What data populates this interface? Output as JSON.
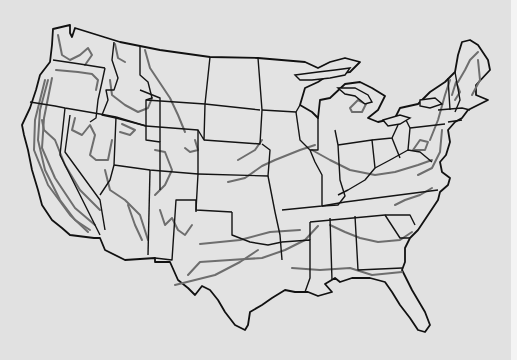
{
  "map": {
    "subject": "Contiguous United States with state boundaries and gray isolines",
    "colors": {
      "background": "#e1e1e1",
      "right_strip": "#f4f4f4",
      "land": "#e3e3e3",
      "state_borders": "#141414",
      "isolines": "#6e6e6e"
    },
    "outline": "M53,29 L70,25 L70,33 L72,37 L75,28 L120,42 L160,50 L210,57 L258,58 L305,62 L318,68 L330,62 L345,58 L360,62 L350,72 L330,74 L318,82 L305,88 L300,105 L312,112 L318,118 L320,100 L330,98 L345,84 L360,82 L372,88 L385,96 L378,110 L368,118 L378,122 L395,118 L400,108 L418,104 L430,92 L445,82 L455,72 L458,55 L462,42 L470,40 L478,45 L488,60 L490,70 L476,85 L476,95 L488,100 L468,110 L462,118 L455,122 L448,130 L450,142 L446,155 L440,162 L442,172 L450,178 L448,185 L440,192 L438,200 L428,215 L418,230 L410,238 L405,248 L405,262 L402,270 L412,290 L425,312 L430,325 L425,332 L418,330 L410,318 L400,305 L392,292 L385,282 L370,278 L352,278 L340,282 L335,278 L325,284 L332,292 L318,296 L308,292 L295,292 L285,290 L272,298 L262,305 L250,312 L248,325 L245,330 L235,325 L225,312 L218,300 L210,290 L202,286 L195,295 L188,288 L178,280 L170,262 L155,262 L155,258 L125,260 L105,250 L100,238 L94,238 L70,235 L62,228 L52,220 L42,205 L38,190 L32,170 L28,150 L24,135 L22,125 L30,108 L36,90 L40,75 L50,62 L52,45 Z",
    "lakes": [
      "M295,75 L318,72 L335,70 L350,68 L345,75 L330,78 L312,80 L300,80 Z",
      "M338,88 L355,88 L368,95 L372,102 L365,104 L355,96 L345,94 Z",
      "M383,120 L400,115 L410,118 L400,124 L388,126 Z",
      "M420,100 L435,98 L442,104 L430,108 L420,106 Z"
    ],
    "borders": [
      "M30,102 L55,106 L65,108 L100,114 L116,117",
      "M53,60 L80,64 L105,68",
      "M105,68 L102,82 L98,100 L96,118 L90,122",
      "M114,42 L112,60 L118,78 L114,90 L106,90 L108,100 L102,115 L116,118 L146,126 L146,100 L152,98 L148,82 L140,75 L140,46",
      "M65,108 L60,155 L100,235",
      "M70,115 L65,152 L100,200 L105,230",
      "M116,117 L114,165 L110,180 L100,195",
      "M116,117 L146,126 L146,140 L160,142 L160,190",
      "M114,165 L150,170 L198,174 L198,130 L146,126",
      "M150,170 L148,255",
      "M160,142 L160,98 L140,90",
      "M146,100 L205,104 L210,57",
      "M205,104 L204,140 L198,130",
      "M204,140 L260,144 L262,110 L258,58",
      "M205,104 L260,110",
      "M262,110 L296,112 L300,105",
      "M198,174 L268,176 L270,150 L262,144",
      "M198,174 L196,210 L232,212",
      "M268,176 L275,212 L280,235 L282,260",
      "M232,212 L232,235 L250,242 L268,245 L282,242",
      "M155,258 L172,260 L176,200 L196,200 L196,212",
      "M282,210 L322,206 L322,175 L315,162 L310,150",
      "M310,150 L300,140 L296,112",
      "M322,206 L338,205 L345,196 L340,180 L338,145 L335,130",
      "M318,118 L318,150 L310,150",
      "M338,145 L372,140 L375,168 L365,180 L348,190 L338,195",
      "M372,140 L392,138 L398,125",
      "M375,168 L390,160 L408,150 L420,152 L432,162",
      "M392,138 L400,158",
      "M408,150 L410,128 L445,124",
      "M410,128 L405,118",
      "M322,206 L345,202 L438,190",
      "M310,222 L385,215 L410,215 L415,225",
      "M282,242 L310,240 L310,278 L305,292",
      "M310,222 L310,240",
      "M330,218 L332,280",
      "M355,216 L358,270 L402,268",
      "M385,215 L400,238 L410,238",
      "M455,72 L460,100 L455,112",
      "M448,78 L450,110",
      "M438,110 L462,108 L470,110",
      "M448,122 L462,120"
    ],
    "contours": [
      "M58,35 L62,55 L70,60 L80,55 L88,48 L92,55 L85,65",
      "M56,70 L78,72 L92,74 L98,80 L96,90",
      "M48,80 L40,110 L38,140 L45,170 L60,200 L75,220 L90,230",
      "M45,80 L35,120 L34,150 L48,185 L70,215 L88,232",
      "M52,78 L44,118 L42,148 L55,178 L75,208 L95,225",
      "M42,120 L44,130 L55,140 L65,165 L80,190 L100,210",
      "M75,118 L72,130 L82,135 L90,125 L95,135 L90,155 L96,160 L108,160 L112,140",
      "M110,80 L112,95 L125,105 L138,112 L148,108 L152,98",
      "M122,124 L135,130 L130,135 L120,132",
      "M145,50 L150,68 L158,80 L170,98 L178,115 L185,132",
      "M115,44 L118,58 L125,62",
      "M195,140 L198,150 L190,152 L185,148",
      "M105,170 L110,190 L125,200 L140,215 L148,240",
      "M128,205 L135,225 L142,240",
      "M155,150 L165,152 L172,170 L165,185 L155,195",
      "M160,210 L165,225 L172,218 L178,230 L185,235 L192,225",
      "M175,285 L195,280 L215,275 L240,262 L258,250",
      "M188,275 L200,262 L230,260 L262,258 L285,250 L305,240 L318,226",
      "M200,244 L240,240 L270,232 L300,230",
      "M228,182 L245,178 L262,166 L275,160 L300,150 L315,145",
      "M238,160 L255,150 L262,140",
      "M312,150 L330,160 L350,170 L375,175 L395,172 L418,165 L432,160",
      "M330,225 L345,232 L360,238 L378,242 L400,240 L412,232",
      "M292,268 L320,270 L350,268 L372,275 L402,272",
      "M395,205 L405,200 L420,195 L432,188",
      "M418,175 L432,168 L440,152 L442,130",
      "M430,140 L438,120 L445,95 L450,80",
      "M458,82 L465,70 L470,60 L478,52",
      "M452,95 L456,82 L460,92 L455,100",
      "M413,150 L420,140 L428,142 L425,150 Z",
      "M350,108 L358,100 L366,104 L362,112 L352,112 Z",
      "M478,60 L480,80 L472,95"
    ]
  }
}
